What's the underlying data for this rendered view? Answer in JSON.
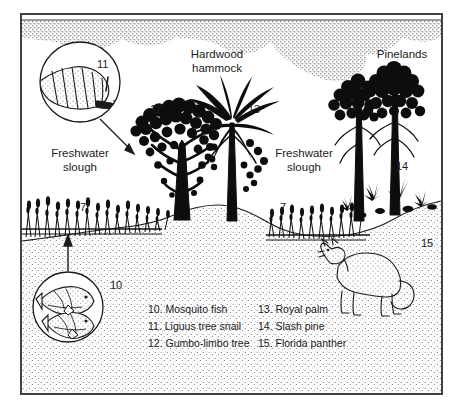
{
  "figure": {
    "border_color": "#3e4246",
    "ink_color": "#111111",
    "background": "#ffffff"
  },
  "place_labels": [
    {
      "id": "hardwood-hammock",
      "line1": "Hardwood",
      "line2": "hammock"
    },
    {
      "id": "pinelands",
      "line1": "Pinelands",
      "line2": ""
    },
    {
      "id": "freshwater-slough-left",
      "line1": "Freshwater",
      "line2": "slough"
    },
    {
      "id": "freshwater-slough-right",
      "line1": "Freshwater",
      "line2": "slough"
    }
  ],
  "callout_numbers": {
    "snail": "11",
    "gumbo_limbo": "12",
    "royal_palm": "13",
    "slash_pine": "14",
    "panther": "15",
    "mosquito_fish": "10",
    "sawgrass_left": "7",
    "sawgrass_right": "7"
  },
  "legend": {
    "left_column": [
      "10. Mosquito fish",
      "11. Liguus tree snail",
      "12. Gumbo-limbo tree"
    ],
    "right_column": [
      "13. Royal palm",
      "14. Slash pine",
      "15. Florida panther"
    ]
  },
  "illustrations": [
    {
      "name": "liguus-tree-snail-inset",
      "label": "11"
    },
    {
      "name": "mosquito-fish-inset",
      "label": "10"
    },
    {
      "name": "gumbo-limbo-tree",
      "label": "12"
    },
    {
      "name": "royal-palm-tree",
      "label": "13"
    },
    {
      "name": "slash-pine-trees",
      "label": "14"
    },
    {
      "name": "florida-panther",
      "label": "15"
    },
    {
      "name": "sawgrass-marsh",
      "label": "7"
    },
    {
      "name": "stippled-clouds",
      "label": ""
    },
    {
      "name": "waterline",
      "label": ""
    },
    {
      "name": "ground-profile",
      "label": ""
    }
  ]
}
